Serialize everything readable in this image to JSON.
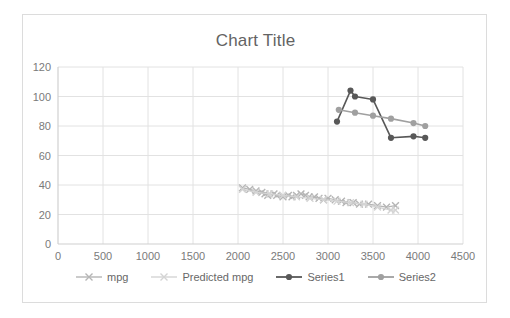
{
  "chart_data": {
    "type": "line",
    "title": "Chart Title",
    "xlabel": "",
    "ylabel": "",
    "xlim": [
      0,
      4500
    ],
    "ylim": [
      0,
      120
    ],
    "xticks": [
      0,
      500,
      1000,
      1500,
      2000,
      2500,
      3000,
      3500,
      4000,
      4500
    ],
    "yticks": [
      0,
      20,
      40,
      60,
      80,
      100,
      120
    ],
    "grid": true,
    "legend_position": "bottom",
    "series": [
      {
        "name": "mpg",
        "color": "#b5b5b5",
        "marker": "x",
        "x": [
          2050,
          2130,
          2200,
          2265,
          2300,
          2330,
          2400,
          2430,
          2500,
          2560,
          2600,
          2650,
          2700,
          2750,
          2790,
          2850,
          2900,
          2950,
          3000,
          3080,
          3150,
          3200,
          3280,
          3350,
          3450,
          3550,
          3650,
          3750
        ],
        "y": [
          38,
          37,
          36,
          35,
          34,
          33,
          34,
          33,
          32,
          33,
          32,
          33,
          34,
          33,
          32,
          32,
          31,
          30,
          31,
          30,
          29,
          28,
          28,
          27,
          27,
          26,
          25,
          26
        ]
      },
      {
        "name": "Predicted mpg",
        "color": "#d4d4d4",
        "marker": "x",
        "x": [
          2050,
          2200,
          2350,
          2500,
          2650,
          2800,
          2950,
          3100,
          3250,
          3400,
          3550,
          3700,
          3750
        ],
        "y": [
          37,
          35,
          34,
          33,
          32,
          31,
          30,
          29,
          28,
          27,
          25,
          23,
          23
        ]
      },
      {
        "name": "Series1",
        "color": "#585858",
        "marker": "circle",
        "x": [
          3100,
          3250,
          3300,
          3500,
          3700,
          3950,
          4080
        ],
        "y": [
          83,
          104,
          100,
          98,
          72,
          73,
          72
        ]
      },
      {
        "name": "Series2",
        "color": "#a0a0a0",
        "marker": "circle",
        "x": [
          3120,
          3300,
          3500,
          3700,
          3950,
          4080
        ],
        "y": [
          91,
          89,
          87,
          85,
          82,
          80
        ]
      }
    ]
  },
  "legend": {
    "items": [
      {
        "label": "mpg",
        "color": "#b5b5b5",
        "marker": "x"
      },
      {
        "label": "Predicted mpg",
        "color": "#d4d4d4",
        "marker": "x"
      },
      {
        "label": "Series1",
        "color": "#585858",
        "marker": "circle"
      },
      {
        "label": "Series2",
        "color": "#a0a0a0",
        "marker": "circle"
      }
    ]
  },
  "colors": {
    "frame_border": "#dcdcdc",
    "gridline": "#e2e2e2",
    "axis_line": "#d0d0d0",
    "title_text": "#636363",
    "tick_text": "#7a7a7a"
  }
}
